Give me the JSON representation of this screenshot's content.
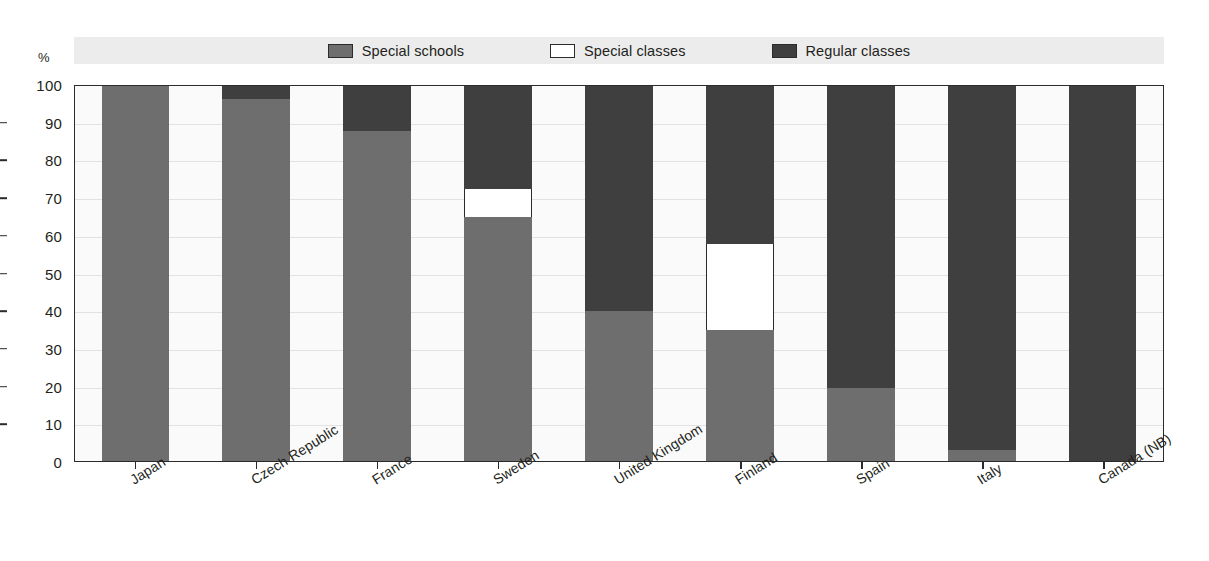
{
  "unit_label": "%",
  "legend": {
    "items": [
      {
        "label": "Special schools",
        "key": "special_schools",
        "color": "#6e6e6e"
      },
      {
        "label": "Special classes",
        "key": "special_classes",
        "color": "#ffffff"
      },
      {
        "label": "Regular classes",
        "key": "regular_classes",
        "color": "#3f3f3f"
      }
    ]
  },
  "chart_data": {
    "type": "bar",
    "stacked": true,
    "title": "",
    "xlabel": "",
    "ylabel": "%",
    "ylim": [
      0,
      100
    ],
    "yticks": [
      0,
      10,
      20,
      30,
      40,
      50,
      60,
      70,
      80,
      90,
      100
    ],
    "grid": true,
    "legend_position": "top",
    "categories": [
      "Japan",
      "Czech Republic",
      "France",
      "Sweden",
      "United Kingdom",
      "Finland",
      "Spain",
      "Italy",
      "Canada (NB)"
    ],
    "series": [
      {
        "name": "Special schools",
        "color": "#6e6e6e",
        "values": [
          100,
          96.5,
          88,
          65,
          40,
          35,
          19.5,
          3,
          0
        ]
      },
      {
        "name": "Special classes",
        "color": "#ffffff",
        "values": [
          0,
          0,
          0,
          7.5,
          0,
          23,
          0,
          0,
          0
        ]
      },
      {
        "name": "Regular classes",
        "color": "#3f3f3f",
        "values": [
          0,
          3.5,
          12,
          27.5,
          60,
          42,
          80.5,
          97,
          100
        ]
      }
    ]
  }
}
